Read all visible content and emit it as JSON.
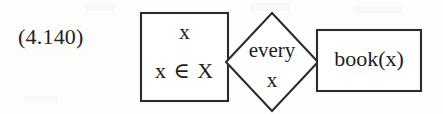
{
  "equation": {
    "number": "(4.140)"
  },
  "diagram": {
    "type": "drs-box-diagram",
    "stroke_color": "#2c2c2c",
    "background_color": "#fdfdfc",
    "nodes": [
      {
        "id": "left-box",
        "shape": "rectangle",
        "lines": [
          "x",
          "x ∈ X"
        ]
      },
      {
        "id": "quantifier-diamond",
        "shape": "diamond",
        "lines": [
          "every",
          "x"
        ]
      },
      {
        "id": "right-box",
        "shape": "rectangle",
        "lines": [
          "book(x)"
        ]
      }
    ]
  }
}
